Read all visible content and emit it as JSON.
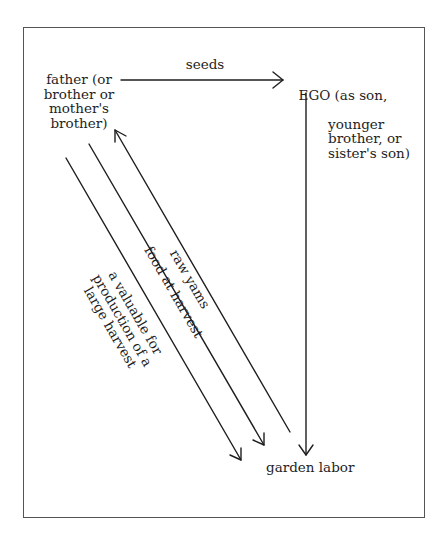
{
  "nodes": {
    "father": {
      "label": "father (or\nbrother or\nmother's\nbrother)"
    },
    "ego": {
      "first_line": "EGO (as son,",
      "rest": "younger\nbrother, or\nsister's son)"
    },
    "garden": {
      "label": "garden labor"
    }
  },
  "edges": [
    {
      "id": "seeds",
      "from": "father",
      "to": "ego",
      "label": "seeds"
    },
    {
      "id": "raw_yams",
      "from": "garden",
      "to": "father",
      "label": "raw yams"
    },
    {
      "id": "food_at_harvest",
      "from": "father",
      "to": "garden",
      "label": "food at harvest"
    },
    {
      "id": "valuable",
      "from": "father",
      "to": "garden",
      "label": "a valuable for\nproduction of a\nlarge harvest"
    },
    {
      "id": "ego_labor",
      "from": "ego",
      "to": "garden",
      "label": ""
    }
  ],
  "colors": {
    "line": "#1e1e1e",
    "frame": "#555555",
    "background": "#ffffff"
  }
}
